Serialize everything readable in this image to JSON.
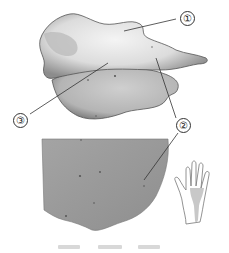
{
  "figure": {
    "type": "anatomical illustration",
    "top_panel": {
      "subject": "mushroom-like specimen (side view)"
    },
    "bottom_panel": {
      "subject": "close-up of specimen surface texture"
    },
    "inset": {
      "subject": "hand outline with shaded palm region",
      "icon": "hand-icon",
      "shade_color": "#c8c8c8"
    },
    "labels": [
      {
        "id": "1",
        "text": "①"
      },
      {
        "id": "2",
        "text": "②"
      },
      {
        "id": "3",
        "text": "③"
      }
    ],
    "caption": {
      "text": "",
      "note": "blurred, illegible"
    }
  },
  "colors": {
    "specimen_light": "#ececec",
    "specimen_shadow": "#8a8a8a",
    "surface": "#9a9a9a",
    "leader_line": "#333333"
  }
}
